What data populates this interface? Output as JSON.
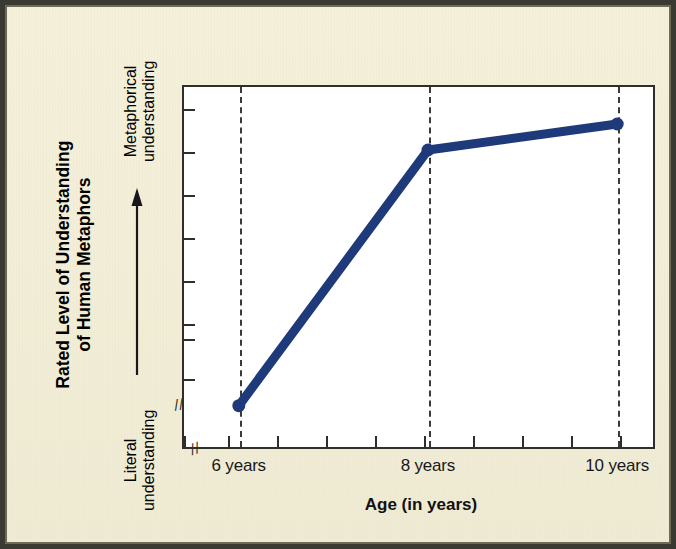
{
  "figure": {
    "background_color": "#f4f0da",
    "plot_background_color": "#ffffff",
    "frame_color": "#3a3a32",
    "line_color": "#1e3a7a",
    "axis_color": "#2e2e2a",
    "gridline_color": "#3a3a38",
    "axis_break_glyph": "//"
  },
  "chart_data": {
    "type": "line",
    "title": "",
    "xlabel": "Age (in years)",
    "ylabel": "Rated Level of Understanding of Human Metaphors",
    "categories": [
      "6 years",
      "8 years",
      "10 years"
    ],
    "x": [
      6,
      8,
      10
    ],
    "values": [
      1.0,
      6.9,
      7.5
    ],
    "series": [
      {
        "name": "Rated level of understanding of human metaphors",
        "values": [
          1.0,
          6.9,
          7.5
        ]
      }
    ],
    "xlim": [
      5.4,
      10.4
    ],
    "ylim": [
      0,
      8.4
    ],
    "y_axis_low_anchor": "Literal understanding",
    "y_axis_high_anchor": "Metaphorical understanding",
    "y_axis_tick_count": 8,
    "x_axis_tick_count": 10,
    "y_axis_labeled_ticks": false,
    "x_axis_labeled_ticks": [
      "6 years",
      "8 years",
      "10 years"
    ],
    "grid": "vertical dashed gridlines at each data point",
    "legend": "none",
    "axis_break_x": true,
    "axis_break_y": true,
    "markers": "filled round dots",
    "annotation": "Upward arrow along y-axis indicating increasing metaphorical understanding"
  },
  "axis_titles": {
    "y_main_line1": "Rated Level of Understanding",
    "y_main_line2": "of Human Metaphors",
    "y_high_line1": "Metaphorical",
    "y_high_line2": "understanding",
    "y_low_line1": "Literal",
    "y_low_line2": "understanding",
    "x_main": "Age (in years)"
  },
  "tick_labels": {
    "x": [
      "6 years",
      "8 years",
      "10 years"
    ]
  }
}
